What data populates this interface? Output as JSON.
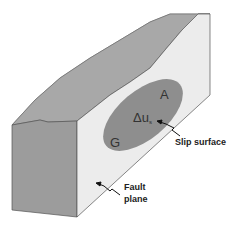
{
  "diagram": {
    "colors": {
      "top_face": "#a8a8a8",
      "front_face": "#9e9e9e",
      "fault_plane_face": "#ececec",
      "slip_patch": "#8e8e8e",
      "outline": "#555555"
    },
    "labels": {
      "area": "A",
      "slip_symbol": "Δu",
      "slip_subscript": "s",
      "modulus": "G",
      "slip_surface": "Slip surface",
      "fault_line1": "Fault",
      "fault_line2": "plane"
    }
  }
}
